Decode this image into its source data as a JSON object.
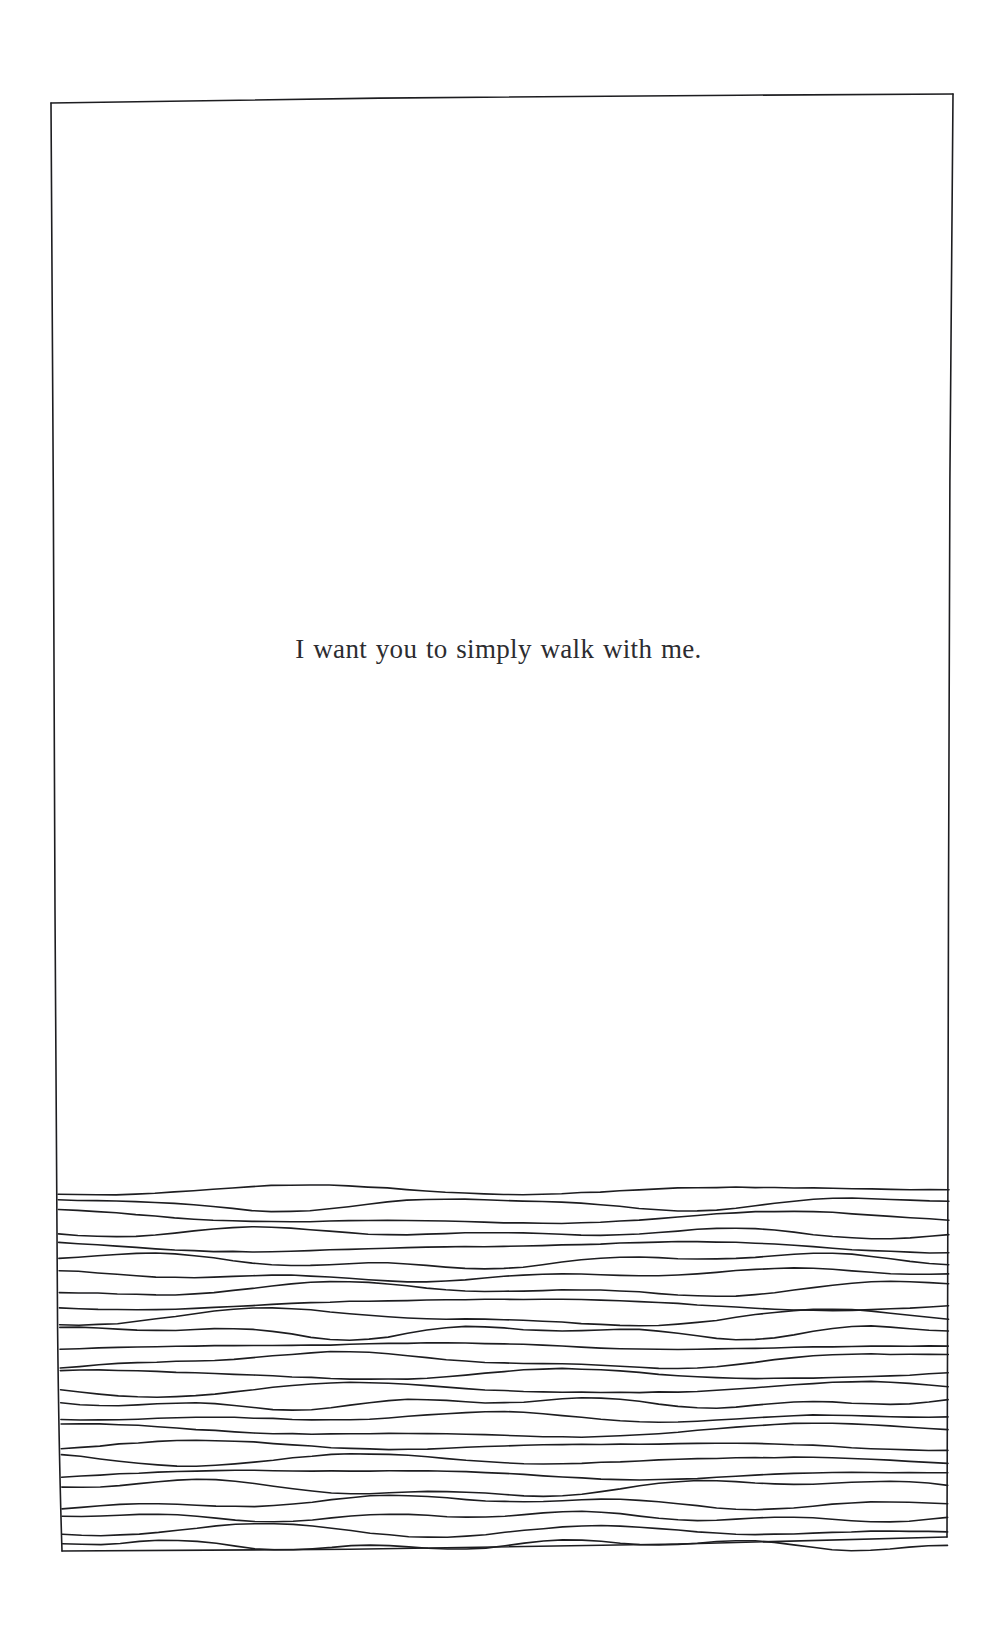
{
  "page": {
    "width": 997,
    "height": 1647,
    "background_color": "#ffffff",
    "medium": "hand-drawn ink line illustration"
  },
  "caption": {
    "text": "I want you to simply walk with me.",
    "color": "#2c2c30",
    "align": "center",
    "font_style": "serif",
    "font_size_px": 27,
    "baseline_y": 665
  },
  "frame": {
    "name": "hand-drawn-rectangular-border",
    "stroke_color": "#1d1d20",
    "stroke_width": 1.6,
    "corners": {
      "top_left": [
        51,
        103
      ],
      "top_right": [
        953,
        94
      ],
      "bottom_right": [
        947,
        1537
      ],
      "bottom_left": [
        62,
        1551
      ]
    }
  },
  "hatching": {
    "name": "wavy-horizontal-hatch-band",
    "description": "band of wavy horizontal ink lines filling the lower portion of the frame, suggesting water or ground",
    "stroke_color": "#1d1d20",
    "stroke_width": 1.6,
    "line_count": 26,
    "top_y": 1190,
    "bottom_y": 1545,
    "average_spacing_px": 14,
    "left_x": 58,
    "right_x": 949,
    "wave_amplitude_px": 6
  }
}
